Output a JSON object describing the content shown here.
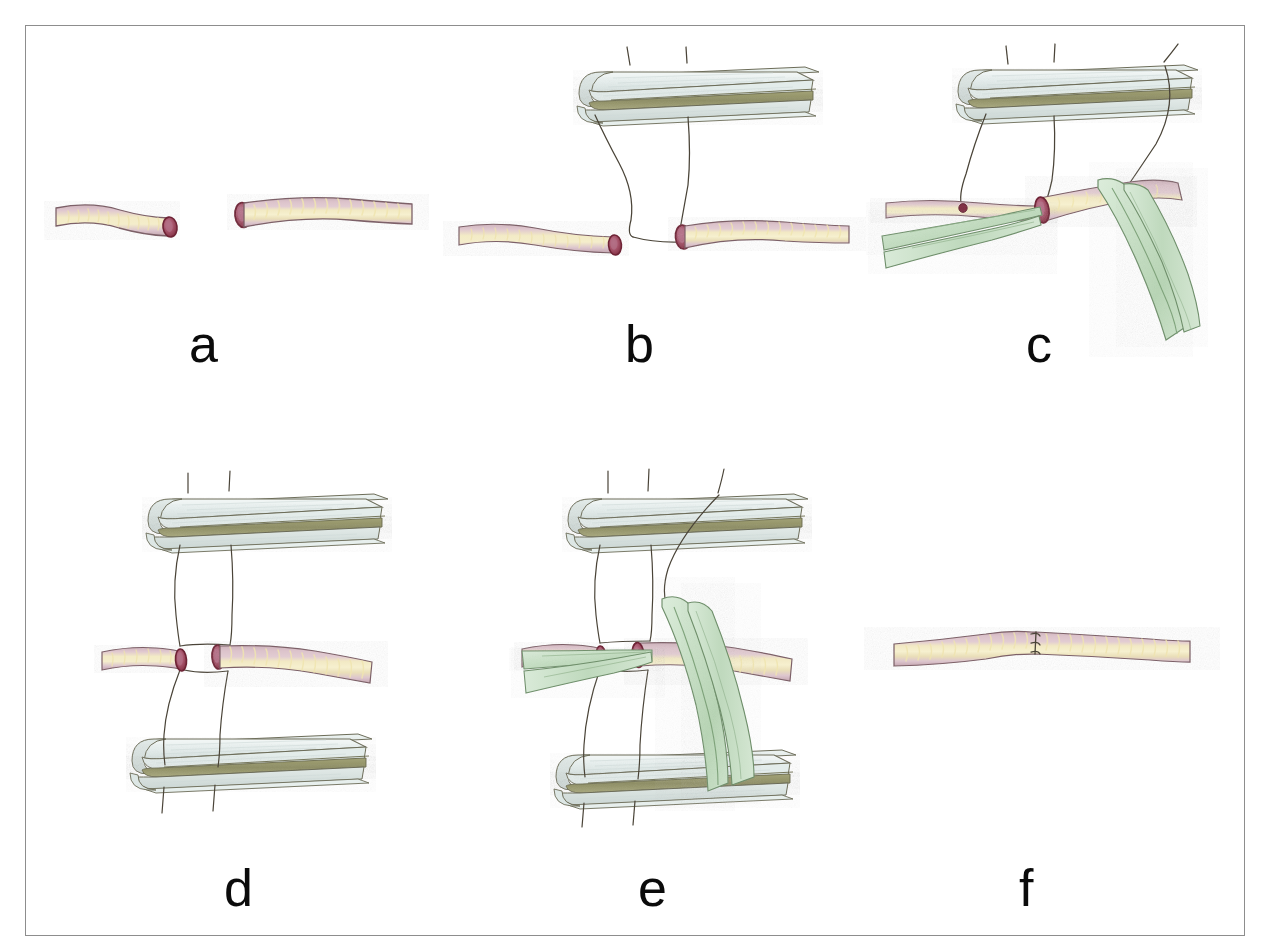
{
  "figure": {
    "kind": "hand-drawn colored-pencil surgical illustration",
    "background_color": "#ffffff",
    "frame_color": "#8d8d8d",
    "panel_count": 6
  },
  "palette": {
    "vessel_wall": "#d8bfc6",
    "vessel_wall_shade": "#c0a2ad",
    "vessel_outline": "#7d6168",
    "vessel_lumen_stripe": "#efe3ae",
    "vessel_lumen_stripe_light": "#f7efc8",
    "cut_end_rim": "#7e2b41",
    "cut_end_fill": "#a8566d",
    "cut_end_highlight": "#c17a90",
    "sponge_body": "#e9f0ee",
    "sponge_shade": "#d6e0de",
    "sponge_outline": "#6c6c58",
    "sponge_midband": "#9a9a6e",
    "forceps_green": "#cfe4ce",
    "forceps_green_dark": "#a9c9a6",
    "forceps_outline": "#6f8f6b",
    "suture_thread": "#4a4438",
    "label_text": "#0b0b0b"
  },
  "panels": [
    {
      "id": "a",
      "label": "a",
      "label_x": 189,
      "label_y": 318,
      "caption_meaning": "Two transected vessel ends lying free, no sutures placed",
      "elements": [
        "vessel-stump-left",
        "vessel-stump-right"
      ]
    },
    {
      "id": "b",
      "label": "b",
      "label_x": 625,
      "label_y": 318,
      "caption_meaning": "Upper sponge block positioned above; two sutures run from block down to each vessel end",
      "elements": [
        "sponge-block-upper",
        "suture-thread",
        "vessel-stump-left",
        "vessel-stump-right"
      ]
    },
    {
      "id": "c",
      "label": "c",
      "label_x": 1026,
      "label_y": 318,
      "caption_meaning": "Forceps approximate the vessel ends while the suture is tied against the upper sponge",
      "elements": [
        "sponge-block-upper",
        "suture-thread",
        "vessel-stump-left",
        "vessel-stump-right",
        "forceps-left",
        "forceps-right"
      ]
    },
    {
      "id": "d",
      "label": "d",
      "label_x": 224,
      "label_y": 862,
      "caption_meaning": "Upper and lower sponge blocks with sutures passing through both vessel ends",
      "elements": [
        "sponge-block-upper",
        "sponge-block-lower",
        "suture-thread",
        "vessel-stump-left",
        "vessel-stump-right"
      ]
    },
    {
      "id": "e",
      "label": "e",
      "label_x": 638,
      "label_y": 862,
      "caption_meaning": "Forceps hold the approximated ends between both sponge blocks while the suture is tightened",
      "elements": [
        "sponge-block-upper",
        "sponge-block-lower",
        "suture-thread",
        "vessel-stump-left",
        "vessel-stump-right",
        "forceps-left",
        "forceps-right"
      ]
    },
    {
      "id": "f",
      "label": "f",
      "label_x": 1019,
      "label_y": 862,
      "caption_meaning": "Completed anastomosis: continuous vessel with three interrupted suture knots at the junction",
      "elements": [
        "vessel-anastomosed",
        "suture-knot",
        "suture-knot",
        "suture-knot"
      ]
    }
  ],
  "labels": {
    "a": "a",
    "b": "b",
    "c": "c",
    "d": "d",
    "e": "e",
    "f": "f"
  }
}
